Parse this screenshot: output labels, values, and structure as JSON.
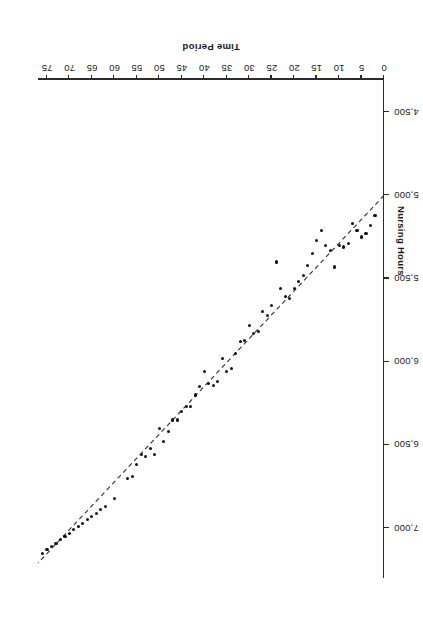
{
  "figure": {
    "background": "#ffffff",
    "orientation": "rotated-180",
    "point_color": "#111111",
    "line_color": "#2b2b2b",
    "axis_color": "#2b2b2b"
  },
  "chart_data": {
    "type": "scatter",
    "title": "",
    "subtitle": "",
    "xlabel": "Time Period",
    "ylabel": "Nursing Hours",
    "xlim": [
      0,
      77
    ],
    "ylim": [
      4300,
      7300
    ],
    "xticks": [
      0,
      5,
      10,
      15,
      20,
      25,
      30,
      35,
      40,
      45,
      50,
      55,
      60,
      65,
      70,
      75
    ],
    "xticklabels": [
      "0",
      "5",
      "10",
      "15",
      "20",
      "25",
      "30",
      "35",
      "40",
      "45",
      "50",
      "55",
      "60",
      "65",
      "70",
      "75"
    ],
    "yticks": [
      4500,
      5000,
      5500,
      6000,
      6500,
      7000
    ],
    "yticklabels": [
      "4,500",
      "5,000",
      "5,500",
      "6,000",
      "6,500",
      "7,000"
    ],
    "grid": false,
    "legend": null,
    "annotations": [],
    "series": [
      {
        "name": "Nursing Hours",
        "marker": "circle",
        "x": [
          2,
          3,
          4,
          5,
          6,
          7,
          8,
          9,
          10,
          11,
          12,
          13,
          14,
          15,
          16,
          17,
          18,
          19,
          20,
          21,
          22,
          23,
          24,
          25,
          26,
          27,
          28,
          29,
          30,
          31,
          32,
          33,
          34,
          35,
          36,
          37,
          38,
          39,
          40,
          41,
          42,
          43,
          44,
          45,
          46,
          47,
          48,
          49,
          50,
          51,
          52,
          53,
          54,
          55,
          56,
          57,
          60,
          62,
          63,
          64,
          65,
          66,
          67,
          68,
          69,
          70,
          71,
          72,
          73,
          74,
          75,
          76
        ],
        "y": [
          5120,
          5180,
          5230,
          5250,
          5210,
          5170,
          5290,
          5310,
          5300,
          5430,
          5330,
          5300,
          5210,
          5270,
          5350,
          5420,
          5480,
          5520,
          5560,
          5620,
          5610,
          5560,
          5400,
          5660,
          5720,
          5700,
          5820,
          5830,
          5780,
          5870,
          5880,
          5950,
          6040,
          6060,
          5980,
          6120,
          6140,
          6130,
          6060,
          6150,
          6200,
          6270,
          6270,
          6300,
          6350,
          6350,
          6420,
          6480,
          6400,
          6560,
          6520,
          6570,
          6560,
          6620,
          6690,
          6700,
          6820,
          6870,
          6890,
          6910,
          6930,
          6950,
          6970,
          6990,
          7010,
          7030,
          7050,
          7070,
          7090,
          7110,
          7130,
          7150
        ]
      }
    ],
    "fit_line": {
      "name": "regression-line",
      "style": "dashed",
      "x": [
        0,
        77
      ],
      "y": [
        5000,
        7210
      ],
      "intercept": 5000,
      "slope": 28.7
    }
  }
}
